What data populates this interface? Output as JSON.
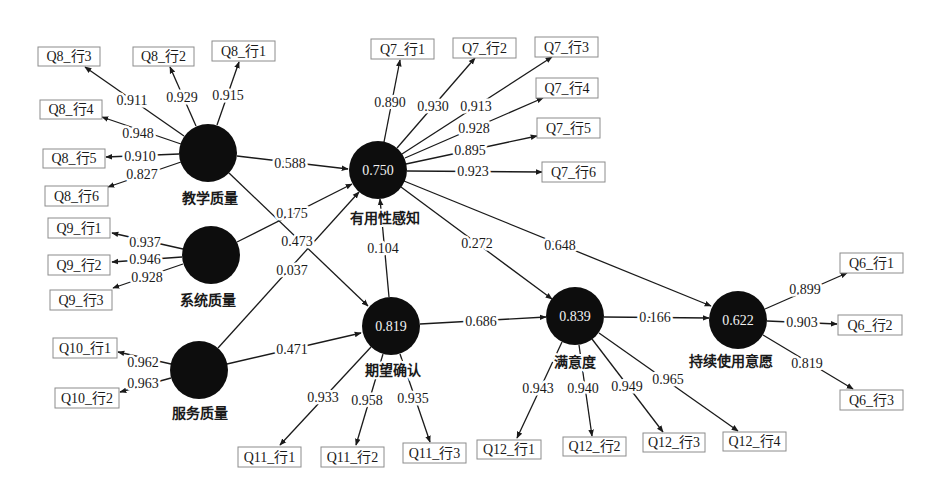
{
  "diagram": {
    "type": "structural-equation-model",
    "constructs": [
      {
        "id": "TQ",
        "name": "教学质量",
        "r2": ""
      },
      {
        "id": "SQ",
        "name": "系统质量",
        "r2": ""
      },
      {
        "id": "SvQ",
        "name": "服务质量",
        "r2": ""
      },
      {
        "id": "PU",
        "name": "有用性感知",
        "r2": "0.750"
      },
      {
        "id": "EC",
        "name": "期望确认",
        "r2": "0.819"
      },
      {
        "id": "SAT",
        "name": "满意度",
        "r2": "0.839"
      },
      {
        "id": "CI",
        "name": "持续使用意愿",
        "r2": "0.622"
      }
    ],
    "indicators": [
      {
        "label": "Q8_行1",
        "construct": "TQ",
        "loading": "0.915"
      },
      {
        "label": "Q8_行2",
        "construct": "TQ",
        "loading": "0.929"
      },
      {
        "label": "Q8_行3",
        "construct": "TQ",
        "loading": "0.911"
      },
      {
        "label": "Q8_行4",
        "construct": "TQ",
        "loading": "0.948"
      },
      {
        "label": "Q8_行5",
        "construct": "TQ",
        "loading": "0.910"
      },
      {
        "label": "Q8_行6",
        "construct": "TQ",
        "loading": "0.827"
      },
      {
        "label": "Q9_行1",
        "construct": "SQ",
        "loading": "0.937"
      },
      {
        "label": "Q9_行2",
        "construct": "SQ",
        "loading": "0.946"
      },
      {
        "label": "Q9_行3",
        "construct": "SQ",
        "loading": "0.928"
      },
      {
        "label": "Q10_行1",
        "construct": "SvQ",
        "loading": "0.962"
      },
      {
        "label": "Q10_行2",
        "construct": "SvQ",
        "loading": "0.963"
      },
      {
        "label": "Q7_行1",
        "construct": "PU",
        "loading": "0.890"
      },
      {
        "label": "Q7_行2",
        "construct": "PU",
        "loading": "0.930"
      },
      {
        "label": "Q7_行3",
        "construct": "PU",
        "loading": "0.913"
      },
      {
        "label": "Q7_行4",
        "construct": "PU",
        "loading": "0.928"
      },
      {
        "label": "Q7_行5",
        "construct": "PU",
        "loading": "0.895"
      },
      {
        "label": "Q7_行6",
        "construct": "PU",
        "loading": "0.923"
      },
      {
        "label": "Q11_行1",
        "construct": "EC",
        "loading": "0.933"
      },
      {
        "label": "Q11_行2",
        "construct": "EC",
        "loading": "0.958"
      },
      {
        "label": "Q11_行3",
        "construct": "EC",
        "loading": "0.935"
      },
      {
        "label": "Q12_行1",
        "construct": "SAT",
        "loading": "0.943"
      },
      {
        "label": "Q12_行2",
        "construct": "SAT",
        "loading": "0.940"
      },
      {
        "label": "Q12_行3",
        "construct": "SAT",
        "loading": "0.949"
      },
      {
        "label": "Q12_行4",
        "construct": "SAT",
        "loading": "0.965"
      },
      {
        "label": "Q6_行1",
        "construct": "CI",
        "loading": "0.899"
      },
      {
        "label": "Q6_行2",
        "construct": "CI",
        "loading": "0.903"
      },
      {
        "label": "Q6_行3",
        "construct": "CI",
        "loading": "0.819"
      }
    ],
    "paths": [
      {
        "from": "TQ",
        "to": "PU",
        "value": "0.588"
      },
      {
        "from": "SQ",
        "to": "PU",
        "value": "0.175"
      },
      {
        "from": "SvQ",
        "to": "PU",
        "value": "0.037"
      },
      {
        "from": "TQ",
        "to": "EC",
        "value": "0.473"
      },
      {
        "from": "SvQ",
        "to": "EC",
        "value": "0.471"
      },
      {
        "from": "EC",
        "to": "PU",
        "value": "0.104"
      },
      {
        "from": "PU",
        "to": "SAT",
        "value": "0.272"
      },
      {
        "from": "PU",
        "to": "CI",
        "value": "0.648"
      },
      {
        "from": "EC",
        "to": "SAT",
        "value": "0.686"
      },
      {
        "from": "SAT",
        "to": "CI",
        "value": "0.166"
      }
    ],
    "colors": {
      "node": "#0d0d0d",
      "line": "#1a1a1a",
      "box_border": "#8c8c8c",
      "background": "#ffffff"
    }
  }
}
